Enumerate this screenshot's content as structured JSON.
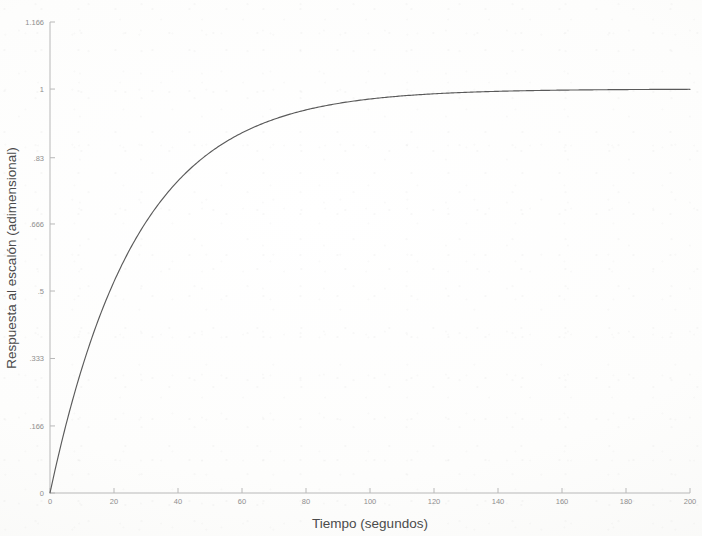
{
  "figure": {
    "kind": "step-response-plot",
    "background_color": "#ffffff",
    "axis_color": "#b4b4b4",
    "tick_label_color": "#8e8e8e",
    "axis_title_color": "#4b4b4b",
    "curve_color": "#5a5a5a"
  },
  "axes": {
    "x_title": "Tiempo (segundos)",
    "y_title": "Respuesta al escalón (adimensional)",
    "x_tick_labels": [
      "0",
      "20",
      "40",
      "60",
      "80",
      "100",
      "120",
      "140",
      "160",
      "180",
      "200"
    ],
    "y_tick_labels": [
      "0",
      ".166",
      ".333",
      ".5",
      ".666",
      ".83",
      "1",
      "1.166"
    ]
  },
  "chart_data": {
    "type": "line",
    "title": "",
    "subtitle": "",
    "xlabel": "Tiempo (segundos)",
    "ylabel": "Respuesta al escalón (adimensional)",
    "xlim": [
      0,
      200
    ],
    "ylim": [
      0,
      1.166
    ],
    "xticks": [
      0,
      20,
      40,
      60,
      80,
      100,
      120,
      140,
      160,
      180,
      200
    ],
    "xticklabels": [
      "0",
      "20",
      "40",
      "60",
      "80",
      "100",
      "120",
      "140",
      "160",
      "180",
      "200"
    ],
    "yticks": [
      0,
      0.166,
      0.333,
      0.5,
      0.666,
      0.83,
      1,
      1.166
    ],
    "yticklabels": [
      "0",
      ".166",
      ".333",
      ".5",
      ".666",
      ".83",
      "1",
      "1.166"
    ],
    "grid": false,
    "legend": null,
    "legend_position": "none",
    "annotations": [],
    "series": [
      {
        "name": "Respuesta al escalón",
        "color": "#5a5a5a",
        "line_width": 1.1,
        "model": "1 - exp(-t/tau)",
        "tau_seconds": 27,
        "steady_state": 1.0,
        "x": [
          0,
          2,
          4,
          6,
          8,
          10,
          12,
          14,
          16,
          18,
          20,
          24,
          28,
          32,
          36,
          40,
          44,
          48,
          52,
          56,
          60,
          68,
          76,
          84,
          92,
          100,
          110,
          120,
          130,
          140,
          150,
          160,
          170,
          180,
          190,
          200
        ],
        "y": [
          0.0,
          0.071,
          0.138,
          0.2,
          0.257,
          0.311,
          0.36,
          0.406,
          0.449,
          0.488,
          0.524,
          0.589,
          0.645,
          0.693,
          0.735,
          0.771,
          0.802,
          0.829,
          0.852,
          0.872,
          0.89,
          0.919,
          0.94,
          0.956,
          0.968,
          0.976,
          0.984,
          0.989,
          0.993,
          0.995,
          0.996,
          0.998,
          0.998,
          0.999,
          0.999,
          1.0
        ]
      }
    ]
  }
}
